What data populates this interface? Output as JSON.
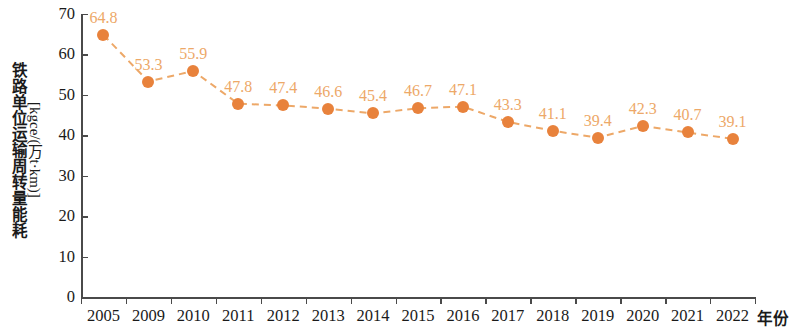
{
  "chart_data": {
    "type": "line",
    "title": "",
    "subtitle": "",
    "xlabel": "年份",
    "ylabel_line1": "铁路单位运输周转量能耗",
    "ylabel_line2": "[kgce/(万t·km)]",
    "categories": [
      "2005",
      "2009",
      "2010",
      "2011",
      "2012",
      "2013",
      "2014",
      "2015",
      "2016",
      "2017",
      "2018",
      "2019",
      "2020",
      "2021",
      "2022"
    ],
    "values": [
      64.8,
      53.3,
      55.9,
      47.8,
      47.4,
      46.6,
      45.4,
      46.7,
      47.1,
      43.3,
      41.1,
      39.4,
      42.3,
      40.7,
      39.1
    ],
    "point_labels": [
      "64.8",
      "53.3",
      "55.9",
      "47.8",
      "47.4",
      "46.6",
      "45.4",
      "46.7",
      "47.1",
      "43.3",
      "41.1",
      "39.4",
      "42.3",
      "40.7",
      "39.1"
    ],
    "ylim": [
      0,
      70
    ],
    "yticks": [
      0,
      10,
      20,
      30,
      40,
      50,
      60,
      70
    ],
    "ytick_labels": [
      "0",
      "10",
      "20",
      "30",
      "40",
      "50",
      "60",
      "70"
    ],
    "grid": false,
    "legend": false,
    "legend_position": "none",
    "series_name": "铁路单位运输周转量能耗",
    "marker_color": "#e8823c",
    "line_color": "#eda868",
    "label_color": "#eda868",
    "line_style": "dashed",
    "marker": "circle",
    "axis_color": "#4a4a4a",
    "background": "#ffffff"
  }
}
